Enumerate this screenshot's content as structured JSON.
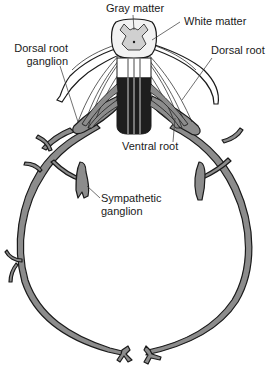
{
  "diagram": {
    "colors": {
      "nerve_fill": "#8c8c8c",
      "nerve_outline": "#1a1a1a",
      "gray_matter": "#d0d0d0",
      "white_matter": "#f2f2f2",
      "cord_dark": "#1e1e1e",
      "leader_line": "#333333"
    },
    "labels": {
      "gray_matter": "Gray matter",
      "white_matter": "White matter",
      "dorsal_root_ganglion_line1": "Dorsal root",
      "dorsal_root_ganglion_line2": "ganglion",
      "dorsal_root": "Dorsal root",
      "ventral_root": "Ventral root",
      "sympathetic_ganglion_line1": "Sympathetic",
      "sympathetic_ganglion_line2": "ganglion"
    }
  }
}
